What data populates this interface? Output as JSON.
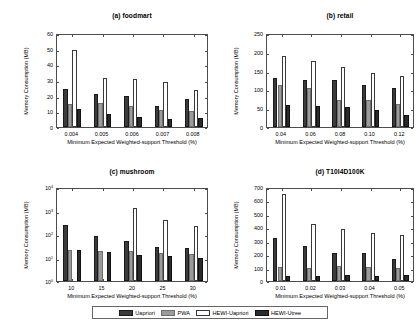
{
  "figure": {
    "width": 419,
    "height": 330,
    "background": "#ffffff"
  },
  "legend": {
    "position": "bottom-center",
    "entries": [
      {
        "label": "Uapriori",
        "color": "#3b3b3b"
      },
      {
        "label": "PWA",
        "color": "#9b9b9b"
      },
      {
        "label": "HEWI-Uapriori",
        "color": "#ffffff"
      },
      {
        "label": "HEWI-Utree",
        "color": "#2b2b2b"
      }
    ]
  },
  "chart_data": [
    {
      "type": "bar",
      "panel": "a",
      "title": "(a) foodmart",
      "xlabel": "Minimum Expected Weighted-support Threshold (%)",
      "ylabel": "Memory Consumption (MB)",
      "categories": [
        "0.004",
        "0.005",
        "0.006",
        "0.007",
        "0.008"
      ],
      "yticks": [
        "0",
        "10",
        "20",
        "30",
        "40",
        "50",
        "60"
      ],
      "ylim": [
        0,
        60
      ],
      "yscale": "linear",
      "grid": false,
      "series": [
        {
          "name": "Uapriori",
          "values": [
            24.3,
            21.2,
            20.0,
            13.5,
            18.2
          ]
        },
        {
          "name": "PWA",
          "values": [
            14.5,
            15.2,
            13.7,
            10.6,
            10.3
          ]
        },
        {
          "name": "HEWI-Uapriori",
          "values": [
            49.0,
            31.0,
            30.8,
            29.0,
            23.5
          ]
        },
        {
          "name": "HEWI-Utree",
          "values": [
            11.5,
            8.0,
            6.2,
            4.8,
            5.5
          ]
        }
      ]
    },
    {
      "type": "bar",
      "panel": "b",
      "title": "(b) retail",
      "xlabel": "Minimum Expected Weighted-support Threshold (%)",
      "ylabel": "Memory Consumption (MB)",
      "categories": [
        "0.04",
        "0.06",
        "0.08",
        "0.10",
        "0.12"
      ],
      "yticks": [
        "0",
        "50",
        "100",
        "150",
        "200",
        "250"
      ],
      "ylim": [
        0,
        250
      ],
      "yscale": "linear",
      "grid": false,
      "series": [
        {
          "name": "Uapriori",
          "values": [
            131,
            125,
            125,
            111,
            103
          ]
        },
        {
          "name": "PWA",
          "values": [
            111,
            104,
            72,
            73,
            62
          ]
        },
        {
          "name": "HEWI-Uapriori",
          "values": [
            190,
            176,
            160,
            144,
            137
          ]
        },
        {
          "name": "HEWI-Utree",
          "values": [
            58,
            55,
            52,
            45,
            33
          ]
        }
      ]
    },
    {
      "type": "bar",
      "panel": "c",
      "title": "(c) mushroom",
      "xlabel": "Minimum Expected Weighted-support Threshold (%)",
      "ylabel": "Memory Consumption (MB)",
      "categories": [
        "10",
        "15",
        "20",
        "25",
        "30"
      ],
      "yticks": [
        "10^0",
        "10^1",
        "10^2",
        "10^3",
        "10^4"
      ],
      "ylim": [
        1,
        10000
      ],
      "yscale": "log",
      "grid": false,
      "series": [
        {
          "name": "Uapriori",
          "values": [
            250,
            84,
            52,
            29,
            25
          ]
        },
        {
          "name": "PWA",
          "values": [
            21,
            19,
            19,
            15,
            14
          ]
        },
        {
          "name": "HEWI-Uapriori",
          "values": [
            null,
            null,
            1300,
            390,
            210
          ]
        },
        {
          "name": "HEWI-Utree",
          "values": [
            20,
            17,
            12.5,
            11.8,
            9.7
          ]
        }
      ]
    },
    {
      "type": "bar",
      "panel": "d",
      "title": "(d) T10I4D100K",
      "xlabel": "Minimum Expected Weighted-support Threshold (%)",
      "ylabel": "Memory Consumption (MB)",
      "categories": [
        "0.01",
        "0.02",
        "0.03",
        "0.04",
        "0.05"
      ],
      "yticks": [
        "0",
        "100",
        "200",
        "300",
        "400",
        "500",
        "600",
        "700"
      ],
      "ylim": [
        0,
        700
      ],
      "yscale": "linear",
      "grid": false,
      "series": [
        {
          "name": "Uapriori",
          "values": [
            320,
            258,
            209,
            207,
            166
          ]
        },
        {
          "name": "PWA",
          "values": [
            103,
            96,
            113,
            108,
            96
          ]
        },
        {
          "name": "HEWI-Uapriori",
          "values": [
            648,
            428,
            386,
            357,
            342
          ]
        },
        {
          "name": "HEWI-Utree",
          "values": [
            41,
            35,
            46,
            38,
            45
          ]
        }
      ]
    }
  ]
}
